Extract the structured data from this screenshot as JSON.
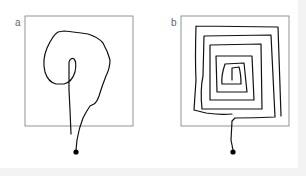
{
  "figure": {
    "panels": [
      {
        "label": "a",
        "description": "Irregular, non-spiral path inside a square region, starting from an external point below",
        "frame_color": "#888888",
        "path_color": "#111111"
      },
      {
        "label": "b",
        "description": "Square inward spiral path filling a square region, starting from an external point below",
        "frame_color": "#888888",
        "path_color": "#111111"
      }
    ]
  }
}
